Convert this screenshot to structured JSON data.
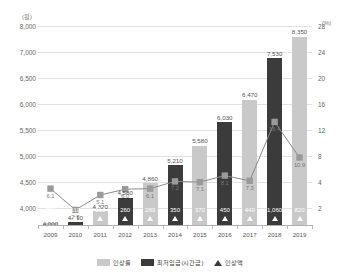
{
  "axes": {
    "left_unit": "(원)",
    "right_unit": "(%)",
    "left_ticks": [
      "8,000",
      "7,000",
      "6,500",
      "6,000",
      "5,500",
      "5,000",
      "4,500",
      "4,000"
    ],
    "right_ticks": [
      "28",
      "24",
      "20",
      "16",
      "12",
      "8",
      "4",
      "2"
    ]
  },
  "legend": {
    "items": [
      {
        "label": "인상률",
        "icon": "square-swatch-light",
        "color": "#c9c9c9"
      },
      {
        "label": "최저임금(시간급)",
        "icon": "square-swatch-dark",
        "color": "#3b3b3b"
      },
      {
        "label": "인상액",
        "icon": "triangle-marker",
        "color": "#3b3b3b"
      }
    ]
  },
  "chart_data": {
    "type": "bar",
    "title": "",
    "xlabel": "",
    "ylabel": "",
    "ylim": [
      3800,
      8600
    ],
    "y2lim": [
      0,
      30
    ],
    "grid": true,
    "legend_position": "bottom",
    "categories": [
      "2009",
      "2010",
      "2011",
      "2012",
      "2013",
      "2014",
      "2015",
      "2016",
      "2017",
      "2018",
      "2019"
    ],
    "series": [
      {
        "name": "최저임금(시간급)",
        "type": "bar",
        "values": [
          4000,
          4110,
          4320,
          4580,
          4860,
          5210,
          5580,
          6030,
          6470,
          7530,
          8350
        ],
        "labels": [
          "4,000",
          "4,110",
          "4,320",
          "4,580",
          "4,860",
          "5,210",
          "5,580",
          "6,030",
          "6,470",
          "7,530",
          "8,350"
        ]
      },
      {
        "name": "인상액",
        "type": "bar-inner-label",
        "values": [
          230,
          110,
          210,
          260,
          280,
          350,
          370,
          450,
          440,
          1060,
          820
        ],
        "labels": [
          "230",
          "110",
          "210",
          "260",
          "280",
          "350",
          "370",
          "450",
          "440",
          "1,060",
          "820"
        ]
      },
      {
        "name": "인상률",
        "type": "line",
        "values": [
          6.1,
          2.8,
          5.1,
          6.0,
          6.1,
          7.2,
          7.1,
          8.1,
          7.3,
          16.4,
          10.9
        ],
        "labels": [
          "6.1",
          "2.8",
          "5.1",
          "6.0",
          "6.1",
          "7.2",
          "7.1",
          "8.1",
          "7.3",
          "16.4",
          "10.9"
        ]
      }
    ],
    "bar_shading": [
      "light",
      "dark",
      "light",
      "dark",
      "light",
      "dark",
      "light",
      "dark",
      "light",
      "dark",
      "light"
    ]
  }
}
